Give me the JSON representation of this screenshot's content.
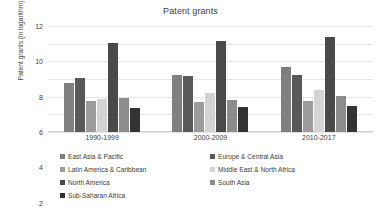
{
  "chart_data": {
    "type": "bar",
    "title": "Patent grants",
    "xlabel": "",
    "ylabel": "Patent grants (in logarithm)",
    "ylim": [
      0,
      12
    ],
    "yticks": [
      0,
      2,
      4,
      6,
      8,
      10,
      12
    ],
    "grid": true,
    "legend_position": "bottom",
    "categories": [
      "1990-1999",
      "2000-2009",
      "2010-2017"
    ],
    "series": [
      {
        "name": "East Asia & Pacific",
        "color": "#808080",
        "values": [
          5.6,
          6.5,
          7.4
        ]
      },
      {
        "name": "Europe & Central Asia",
        "color": "#595959",
        "values": [
          6.1,
          6.3,
          6.5
        ]
      },
      {
        "name": "Latin America & Caribbean",
        "color": "#9c9c9c",
        "values": [
          3.5,
          3.4,
          3.5
        ]
      },
      {
        "name": "Middle East & North Africa",
        "color": "#d4d4d4",
        "values": [
          3.7,
          4.4,
          4.8
        ]
      },
      {
        "name": "North America",
        "color": "#4a4a4a",
        "values": [
          10.1,
          10.3,
          10.7
        ]
      },
      {
        "name": "South Asia",
        "color": "#8c8c8c",
        "values": [
          3.9,
          3.6,
          4.1
        ]
      },
      {
        "name": "Sub-Saharan Africa",
        "color": "#333333",
        "values": [
          2.7,
          2.8,
          3.0
        ]
      }
    ]
  }
}
